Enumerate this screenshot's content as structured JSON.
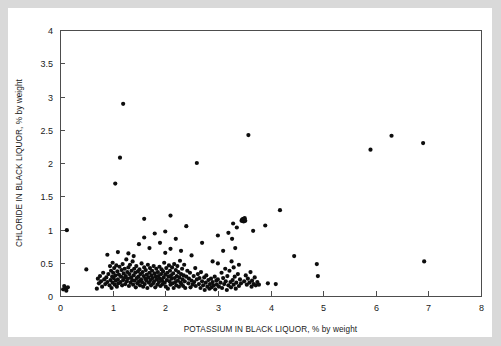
{
  "figure": {
    "background_color": "#ffffff",
    "frame_color": "#d9d9d9",
    "plot_border_color": "#4d4d4d",
    "marker_color": "#0d0d0d"
  },
  "chart_data": {
    "type": "scatter",
    "title": "",
    "xlabel": "POTASSIUM IN BLACK LIQUOR, % by weight",
    "ylabel": "CHLORIDE IN BLACK LIQUOR, % by weight",
    "xlim": [
      0,
      8
    ],
    "ylim": [
      0,
      4
    ],
    "xticks": [
      0,
      1,
      2,
      3,
      4,
      5,
      6,
      7,
      8
    ],
    "xtick_labels": [
      "0",
      "1",
      "2",
      "3",
      "4",
      "5",
      "6",
      "7",
      "8"
    ],
    "yticks": [
      0,
      0.5,
      1,
      1.5,
      2,
      2.5,
      3,
      3.5,
      4
    ],
    "ytick_labels": [
      "0",
      "0.5",
      "1",
      "1.5",
      "2",
      "2.5",
      "3",
      "3.5",
      "4"
    ],
    "grid": false,
    "legend": null,
    "marker": "filled-circle",
    "marker_size": 2.1,
    "series": [
      {
        "name": "Black liquor samples",
        "points": [
          [
            0.06,
            0.1
          ],
          [
            0.08,
            0.15
          ],
          [
            0.1,
            0.12
          ],
          [
            0.12,
            0.08
          ],
          [
            0.13,
            0.99
          ],
          [
            0.15,
            0.13
          ],
          [
            0.5,
            0.4
          ],
          [
            0.7,
            0.11
          ],
          [
            0.72,
            0.26
          ],
          [
            0.74,
            0.19
          ],
          [
            0.76,
            0.3
          ],
          [
            0.78,
            0.22
          ],
          [
            0.8,
            0.14
          ],
          [
            0.82,
            0.35
          ],
          [
            0.84,
            0.25
          ],
          [
            0.86,
            0.18
          ],
          [
            0.88,
            0.28
          ],
          [
            0.9,
            0.21
          ],
          [
            0.9,
            0.62
          ],
          [
            0.92,
            0.33
          ],
          [
            0.94,
            0.16
          ],
          [
            0.95,
            0.45
          ],
          [
            0.96,
            0.24
          ],
          [
            0.97,
            0.38
          ],
          [
            0.98,
            0.12
          ],
          [
            0.99,
            0.29
          ],
          [
            1.0,
            0.2
          ],
          [
            1.0,
            0.5
          ],
          [
            1.01,
            0.35
          ],
          [
            1.02,
            0.27
          ],
          [
            1.03,
            0.42
          ],
          [
            1.04,
            0.17
          ],
          [
            1.05,
            1.69
          ],
          [
            1.05,
            0.31
          ],
          [
            1.06,
            0.23
          ],
          [
            1.07,
            0.46
          ],
          [
            1.08,
            0.14
          ],
          [
            1.09,
            0.37
          ],
          [
            1.1,
            0.25
          ],
          [
            1.1,
            0.66
          ],
          [
            1.11,
            0.19
          ],
          [
            1.12,
            0.32
          ],
          [
            1.13,
            0.44
          ],
          [
            1.14,
            2.08
          ],
          [
            1.15,
            0.21
          ],
          [
            1.16,
            0.29
          ],
          [
            1.17,
            0.39
          ],
          [
            1.18,
            0.16
          ],
          [
            1.19,
            0.48
          ],
          [
            1.2,
            0.24
          ],
          [
            1.2,
            2.89
          ],
          [
            1.21,
            0.34
          ],
          [
            1.22,
            0.27
          ],
          [
            1.23,
            0.41
          ],
          [
            1.24,
            0.18
          ],
          [
            1.25,
            0.3
          ],
          [
            1.26,
            0.55
          ],
          [
            1.27,
            0.22
          ],
          [
            1.28,
            0.36
          ],
          [
            1.29,
            0.26
          ],
          [
            1.3,
            0.43
          ],
          [
            1.3,
            0.64
          ],
          [
            1.31,
            0.15
          ],
          [
            1.32,
            0.33
          ],
          [
            1.33,
            0.47
          ],
          [
            1.34,
            0.2
          ],
          [
            1.35,
            0.28
          ],
          [
            1.36,
            0.38
          ],
          [
            1.37,
            0.24
          ],
          [
            1.38,
            0.52
          ],
          [
            1.39,
            0.17
          ],
          [
            1.4,
            0.31
          ],
          [
            1.4,
            0.6
          ],
          [
            1.41,
            0.41
          ],
          [
            1.42,
            0.23
          ],
          [
            1.43,
            0.35
          ],
          [
            1.44,
            0.13
          ],
          [
            1.45,
            0.45
          ],
          [
            1.46,
            0.27
          ],
          [
            1.47,
            0.19
          ],
          [
            1.48,
            0.37
          ],
          [
            1.49,
            0.29
          ],
          [
            1.5,
            0.22
          ],
          [
            1.5,
            0.78
          ],
          [
            1.51,
            0.4
          ],
          [
            1.52,
            0.16
          ],
          [
            1.53,
            0.33
          ],
          [
            1.54,
            0.25
          ],
          [
            1.55,
            0.49
          ],
          [
            1.56,
            0.21
          ],
          [
            1.57,
            0.36
          ],
          [
            1.58,
            0.14
          ],
          [
            1.59,
            0.3
          ],
          [
            1.6,
            0.43
          ],
          [
            1.6,
            0.88
          ],
          [
            1.6,
            1.16
          ],
          [
            1.61,
            0.18
          ],
          [
            1.62,
            0.26
          ],
          [
            1.63,
            0.39
          ],
          [
            1.64,
            0.23
          ],
          [
            1.65,
            0.32
          ],
          [
            1.66,
            0.12
          ],
          [
            1.67,
            0.47
          ],
          [
            1.68,
            0.28
          ],
          [
            1.69,
            0.2
          ],
          [
            1.7,
            0.35
          ],
          [
            1.7,
            0.72
          ],
          [
            1.71,
            0.42
          ],
          [
            1.72,
            0.24
          ],
          [
            1.73,
            0.16
          ],
          [
            1.74,
            0.31
          ],
          [
            1.75,
            0.38
          ],
          [
            1.76,
            0.27
          ],
          [
            1.77,
            0.19
          ],
          [
            1.78,
            0.45
          ],
          [
            1.79,
            0.22
          ],
          [
            1.8,
            0.34
          ],
          [
            1.8,
            0.94
          ],
          [
            1.81,
            0.13
          ],
          [
            1.82,
            0.29
          ],
          [
            1.83,
            0.41
          ],
          [
            1.84,
            0.25
          ],
          [
            1.85,
            0.17
          ],
          [
            1.86,
            0.36
          ],
          [
            1.87,
            0.3
          ],
          [
            1.88,
            0.21
          ],
          [
            1.89,
            0.44
          ],
          [
            1.9,
            0.26
          ],
          [
            1.9,
            0.8
          ],
          [
            1.91,
            0.15
          ],
          [
            1.92,
            0.33
          ],
          [
            1.93,
            0.4
          ],
          [
            1.94,
            0.23
          ],
          [
            1.95,
            0.18
          ],
          [
            1.96,
            0.37
          ],
          [
            1.97,
            0.28
          ],
          [
            1.98,
            0.5
          ],
          [
            1.99,
            0.2
          ],
          [
            2.0,
            0.32
          ],
          [
            2.0,
            0.65
          ],
          [
            2.0,
            0.97
          ],
          [
            2.01,
            0.14
          ],
          [
            2.02,
            0.42
          ],
          [
            2.03,
            0.24
          ],
          [
            2.04,
            0.35
          ],
          [
            2.05,
            0.11
          ],
          [
            2.06,
            0.29
          ],
          [
            2.07,
            0.46
          ],
          [
            2.08,
            0.22
          ],
          [
            2.09,
            0.38
          ],
          [
            2.1,
            0.17
          ],
          [
            2.1,
            0.71
          ],
          [
            2.1,
            1.21
          ],
          [
            2.11,
            0.31
          ],
          [
            2.12,
            0.26
          ],
          [
            2.13,
            0.43
          ],
          [
            2.14,
            0.19
          ],
          [
            2.15,
            0.34
          ],
          [
            2.16,
            0.12
          ],
          [
            2.17,
            0.48
          ],
          [
            2.18,
            0.27
          ],
          [
            2.19,
            0.21
          ],
          [
            2.2,
            0.39
          ],
          [
            2.2,
            0.86
          ],
          [
            2.21,
            0.16
          ],
          [
            2.22,
            0.3
          ],
          [
            2.23,
            0.45
          ],
          [
            2.24,
            0.23
          ],
          [
            2.25,
            0.36
          ],
          [
            2.26,
            0.14
          ],
          [
            2.27,
            0.28
          ],
          [
            2.28,
            0.53
          ],
          [
            2.29,
            0.2
          ],
          [
            2.3,
            0.33
          ],
          [
            2.3,
            0.68
          ],
          [
            2.31,
            0.18
          ],
          [
            2.32,
            0.41
          ],
          [
            2.33,
            0.25
          ],
          [
            2.34,
            0.15
          ],
          [
            2.35,
            0.31
          ],
          [
            2.36,
            0.47
          ],
          [
            2.37,
            0.22
          ],
          [
            2.38,
            0.12
          ],
          [
            2.4,
            0.29
          ],
          [
            2.4,
            1.05
          ],
          [
            2.42,
            0.38
          ],
          [
            2.44,
            0.19
          ],
          [
            2.45,
            0.26
          ],
          [
            2.47,
            0.35
          ],
          [
            2.48,
            0.13
          ],
          [
            2.5,
            0.23
          ],
          [
            2.5,
            0.61
          ],
          [
            2.52,
            0.17
          ],
          [
            2.54,
            0.3
          ],
          [
            2.55,
            0.21
          ],
          [
            2.57,
            0.42
          ],
          [
            2.58,
            0.15
          ],
          [
            2.6,
            0.25
          ],
          [
            2.6,
            2.0
          ],
          [
            2.62,
            0.33
          ],
          [
            2.64,
            0.18
          ],
          [
            2.65,
            0.27
          ],
          [
            2.67,
            0.12
          ],
          [
            2.68,
            0.36
          ],
          [
            2.7,
            0.22
          ],
          [
            2.7,
            0.8
          ],
          [
            2.72,
            0.16
          ],
          [
            2.74,
            0.28
          ],
          [
            2.75,
            0.09
          ],
          [
            2.77,
            0.2
          ],
          [
            2.78,
            0.31
          ],
          [
            2.8,
            0.14
          ],
          [
            2.82,
            0.24
          ],
          [
            2.84,
            0.11
          ],
          [
            2.85,
            0.18
          ],
          [
            2.87,
            0.26
          ],
          [
            2.88,
            0.13
          ],
          [
            2.9,
            0.21
          ],
          [
            2.9,
            0.52
          ],
          [
            2.92,
            0.16
          ],
          [
            2.94,
            0.29
          ],
          [
            2.95,
            0.1
          ],
          [
            2.97,
            0.23
          ],
          [
            2.98,
            0.17
          ],
          [
            3.0,
            0.25
          ],
          [
            3.0,
            0.49
          ],
          [
            3.0,
            0.91
          ],
          [
            3.02,
            0.14
          ],
          [
            3.05,
            0.2
          ],
          [
            3.07,
            0.35
          ],
          [
            3.08,
            0.12
          ],
          [
            3.1,
            0.27
          ],
          [
            3.1,
            0.68
          ],
          [
            3.12,
            0.18
          ],
          [
            3.14,
            0.41
          ],
          [
            3.15,
            0.22
          ],
          [
            3.17,
            0.09
          ],
          [
            3.18,
            0.3
          ],
          [
            3.2,
            0.16
          ],
          [
            3.2,
            0.95
          ],
          [
            3.22,
            0.38
          ],
          [
            3.24,
            0.21
          ],
          [
            3.25,
            0.13
          ],
          [
            3.26,
            0.52
          ],
          [
            3.27,
            0.86
          ],
          [
            3.28,
            0.24
          ],
          [
            3.29,
            1.09
          ],
          [
            3.3,
            0.17
          ],
          [
            3.3,
            0.43
          ],
          [
            3.32,
            0.29
          ],
          [
            3.33,
            0.72
          ],
          [
            3.34,
            0.11
          ],
          [
            3.35,
            0.2
          ],
          [
            3.36,
            1.03
          ],
          [
            3.38,
            0.33
          ],
          [
            3.4,
            0.15
          ],
          [
            3.4,
            0.47
          ],
          [
            3.42,
            0.25
          ],
          [
            3.44,
            0.19
          ],
          [
            3.45,
            1.13
          ],
          [
            3.46,
            1.15
          ],
          [
            3.47,
            1.14
          ],
          [
            3.48,
            1.16
          ],
          [
            3.49,
            1.12
          ],
          [
            3.5,
            1.15
          ],
          [
            3.5,
            0.22
          ],
          [
            3.51,
            1.17
          ],
          [
            3.52,
            1.13
          ],
          [
            3.53,
            0.31
          ],
          [
            3.55,
            0.17
          ],
          [
            3.57,
            0.26
          ],
          [
            3.58,
            2.42
          ],
          [
            3.6,
            0.2
          ],
          [
            3.62,
            0.36
          ],
          [
            3.64,
            0.14
          ],
          [
            3.65,
            0.23
          ],
          [
            3.67,
            0.98
          ],
          [
            3.68,
            0.18
          ],
          [
            3.7,
            0.28
          ],
          [
            3.72,
            0.16
          ],
          [
            3.75,
            0.21
          ],
          [
            3.78,
            0.17
          ],
          [
            3.9,
            1.06
          ],
          [
            3.95,
            0.19
          ],
          [
            4.1,
            0.18
          ],
          [
            4.18,
            1.29
          ],
          [
            4.45,
            0.6
          ],
          [
            4.88,
            0.48
          ],
          [
            4.9,
            0.3
          ],
          [
            5.9,
            2.2
          ],
          [
            6.3,
            2.41
          ],
          [
            6.9,
            2.3
          ],
          [
            6.92,
            0.52
          ]
        ]
      }
    ]
  }
}
